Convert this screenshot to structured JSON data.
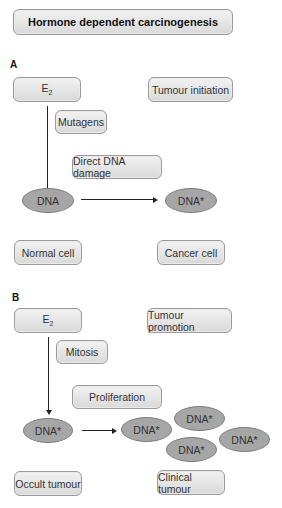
{
  "title": "Hormone dependent carcinogenesis",
  "panel_a": {
    "label": "A",
    "e2": "E",
    "e2_sub": "2",
    "stage": "Tumour initiation",
    "mutagens": "Mutagens",
    "damage": "Direct DNA damage",
    "dna": "DNA",
    "dna_star": "DNA*",
    "normal_cell": "Normal cell",
    "cancer_cell": "Cancer cell"
  },
  "panel_b": {
    "label": "B",
    "e2": "E",
    "e2_sub": "2",
    "stage": "Tumour promotion",
    "mitosis": "Mitosis",
    "proliferation": "Proliferation",
    "dna_star": "DNA*",
    "cluster": [
      "DNA*",
      "DNA*",
      "DNA*",
      "DNA*"
    ],
    "occult": "Occult tumour",
    "clinical": "Clinical tumour"
  }
}
